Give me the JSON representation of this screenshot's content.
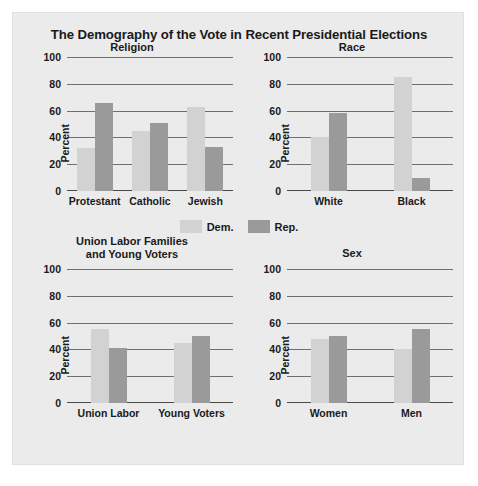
{
  "title": "The Demography of the Vote in Recent Presidential Elections",
  "legend": [
    {
      "key": "dem",
      "label": "Dem.",
      "color": "#d2d2d2"
    },
    {
      "key": "rep",
      "label": "Rep.",
      "color": "#9a9a9a"
    }
  ],
  "ylabel": "Percent",
  "yticks": [
    "0",
    "20",
    "40",
    "60",
    "80",
    "100"
  ],
  "chart_data": [
    {
      "type": "bar",
      "title": "Religion",
      "xlabel": "",
      "ylabel": "Percent",
      "ylim": [
        0,
        100
      ],
      "grid": true,
      "legend_position": "center",
      "categories": [
        "Protestant",
        "Catholic",
        "Jewish"
      ],
      "series": [
        {
          "name": "Dem.",
          "values": [
            32,
            45,
            63
          ]
        },
        {
          "name": "Rep.",
          "values": [
            66,
            51,
            33
          ]
        }
      ]
    },
    {
      "type": "bar",
      "title": "Race",
      "xlabel": "",
      "ylabel": "Percent",
      "ylim": [
        0,
        100
      ],
      "grid": true,
      "legend_position": "center",
      "categories": [
        "White",
        "Black"
      ],
      "series": [
        {
          "name": "Dem.",
          "values": [
            40,
            85
          ]
        },
        {
          "name": "Rep.",
          "values": [
            58,
            10
          ]
        }
      ]
    },
    {
      "type": "bar",
      "title": "Union Labor Families and Young Voters",
      "title_lines": [
        "Union Labor Families",
        "and Young Voters"
      ],
      "xlabel": "",
      "ylabel": "Percent",
      "ylim": [
        0,
        100
      ],
      "grid": true,
      "legend_position": "center",
      "categories": [
        "Union Labor",
        "Young Voters"
      ],
      "series": [
        {
          "name": "Dem.",
          "values": [
            55,
            45
          ]
        },
        {
          "name": "Rep.",
          "values": [
            41,
            50
          ]
        }
      ]
    },
    {
      "type": "bar",
      "title": "Sex",
      "xlabel": "",
      "ylabel": "Percent",
      "ylim": [
        0,
        100
      ],
      "grid": true,
      "legend_position": "center",
      "categories": [
        "Women",
        "Men"
      ],
      "series": [
        {
          "name": "Dem.",
          "values": [
            48,
            40
          ]
        },
        {
          "name": "Rep.",
          "values": [
            50,
            55
          ]
        }
      ]
    }
  ]
}
